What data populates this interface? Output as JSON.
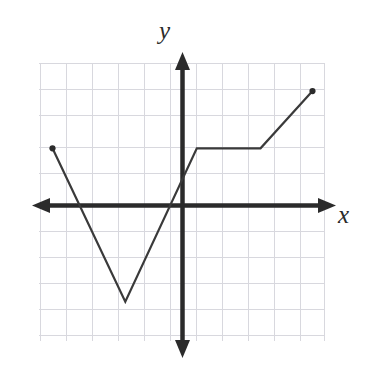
{
  "figure": {
    "title": "",
    "y_axis_label": "y",
    "x_axis_label": "x",
    "background_color": "#ffffff",
    "grid_color": "#d8d8de",
    "axis_color": "#2b2b2b",
    "curve_color": "#3a3a3a",
    "endpoint_dot_color": "#2b2b2b"
  },
  "chart_data": {
    "type": "line",
    "title": "",
    "xlabel": "x",
    "ylabel": "y",
    "grid": true,
    "legend": null,
    "xlim": [
      -5.5,
      5.1
    ],
    "ylim": [
      -5.5,
      5.5
    ],
    "x_tick_step": 1,
    "y_tick_step": 1,
    "axes_arrows": {
      "x_left": true,
      "x_right": true,
      "y_up": true,
      "y_down": true
    },
    "series": [
      {
        "name": "piecewise-linear-function",
        "closed_endpoints": [
          {
            "x": -5.0,
            "y": 2.2
          },
          {
            "x": 5.0,
            "y": 4.4
          }
        ],
        "vertices": [
          {
            "x": -5.0,
            "y": 2.2
          },
          {
            "x": -2.2,
            "y": -3.7
          },
          {
            "x": 0.55,
            "y": 2.2
          },
          {
            "x": 3.0,
            "y": 2.2
          },
          {
            "x": 5.0,
            "y": 4.4
          }
        ],
        "x": [
          -5.0,
          -2.2,
          0.55,
          3.0,
          5.0
        ],
        "y": [
          2.2,
          -3.7,
          2.2,
          2.2,
          4.4
        ],
        "x_intercepts": [
          -3.2,
          -1.2
        ],
        "y_intercept": 0.85
      }
    ]
  },
  "annotations": {
    "y_axis_tip_arrow": "arrow-up-icon",
    "y_axis_bottom_arrow": "arrow-down-icon",
    "x_axis_left_arrow": "arrow-left-icon",
    "x_axis_right_arrow": "arrow-right-icon"
  }
}
